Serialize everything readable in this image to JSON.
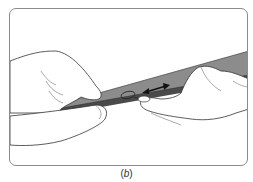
{
  "figure": {
    "caption_open": "(",
    "caption_label": "b",
    "caption_close": ")",
    "colors": {
      "strip_top": "#8c8c8c",
      "strip_edge": "#4a4a4a",
      "outline": "#333333",
      "skin": "#ffffff",
      "frame": "#8a8a8a"
    },
    "icons": [
      "double-headed-arrow-icon",
      "loop-icon"
    ]
  }
}
